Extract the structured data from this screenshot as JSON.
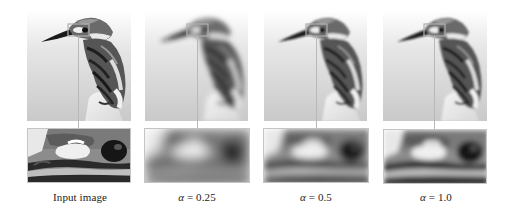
{
  "figure": {
    "panels": [
      {
        "id": "input",
        "caption": "Input image",
        "caption_symbol": "",
        "caption_value": "",
        "blur_main": 0,
        "blur_crop": 0.3,
        "x": 27
      },
      {
        "id": "alpha-0.25",
        "caption": "",
        "caption_symbol": "α",
        "caption_value": " = 0.25",
        "blur_main": 2.4,
        "blur_crop": 5,
        "x": 144
      },
      {
        "id": "alpha-0.5",
        "caption": "",
        "caption_symbol": "α",
        "caption_value": " = 0.5",
        "blur_main": 1.3,
        "blur_crop": 3,
        "x": 263
      },
      {
        "id": "alpha-1.0",
        "caption": "",
        "caption_symbol": "α",
        "caption_value": " = 1.0",
        "blur_main": 0.8,
        "blur_crop": 2,
        "x": 383
      }
    ]
  },
  "colors": {
    "background": "#ffffff",
    "highlight_box": "#b0b0b0",
    "connector": "#b8b8b8",
    "caption_text": "#222222"
  }
}
